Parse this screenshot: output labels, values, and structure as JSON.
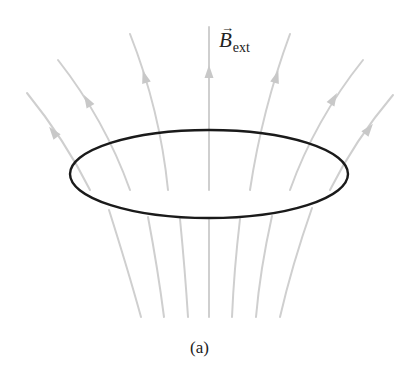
{
  "figure": {
    "field_label": {
      "symbol": "B",
      "vector_arrow": "→",
      "subscript": "ext"
    },
    "caption": "(a)",
    "colors": {
      "field_lines": "#cfcfcf",
      "arrowheads": "#c8c8c8",
      "loop": "#1a1a1a",
      "text": "#222222",
      "background": "#ffffff"
    },
    "loop": {
      "cx": 209,
      "cy": 174,
      "rx": 139,
      "ry": 44
    },
    "upper_field_lines": [
      {
        "d": "M27,93 Q65,140 90,190",
        "arrow": {
          "x": 54,
          "y": 133,
          "angle": -38
        }
      },
      {
        "d": "M58,60 Q105,120 130,190",
        "arrow": {
          "x": 88,
          "y": 102,
          "angle": -30
        }
      },
      {
        "d": "M130,34 Q160,110 168,190",
        "arrow": {
          "x": 145,
          "y": 78,
          "angle": -17
        }
      },
      {
        "d": "M209,27 L209,190",
        "arrow": {
          "x": 209,
          "y": 73,
          "angle": 0
        }
      },
      {
        "d": "M290,34 Q262,110 250,190",
        "arrow": {
          "x": 276,
          "y": 78,
          "angle": 17
        }
      },
      {
        "d": "M363,60 Q315,120 290,190",
        "arrow": {
          "x": 333,
          "y": 100,
          "angle": 30
        }
      },
      {
        "d": "M393,95 Q355,140 330,190",
        "arrow": {
          "x": 368,
          "y": 130,
          "angle": 38
        }
      }
    ],
    "lower_field_lines": [
      {
        "d": "M109,210 Q128,270 141,317"
      },
      {
        "d": "M148,217 Q158,270 164,317"
      },
      {
        "d": "M180,219 Q185,270 188,317"
      },
      {
        "d": "M209,220 L209,317"
      },
      {
        "d": "M240,219 Q234,270 232,317"
      },
      {
        "d": "M272,216 Q260,270 256,317"
      },
      {
        "d": "M312,208 Q292,265 280,317"
      }
    ]
  }
}
